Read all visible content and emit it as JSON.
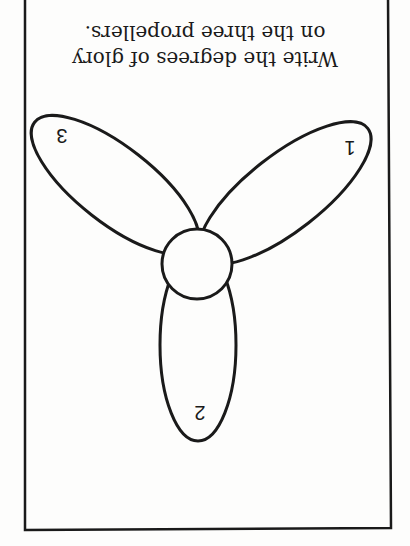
{
  "worksheet": {
    "orientation": "rotated-180",
    "instruction_lines": [
      "Write the degrees of glory",
      "on the three propellers."
    ],
    "propeller": {
      "hub": {
        "shape": "circle"
      },
      "blades": [
        {
          "number": "1",
          "position": "upper-right (as displayed)"
        },
        {
          "number": "2",
          "position": "bottom (as displayed)"
        },
        {
          "number": "3",
          "position": "upper-left (as displayed)"
        }
      ]
    },
    "colors": {
      "ink": "#1a1a1a",
      "paper": "#fdfdfc"
    }
  }
}
